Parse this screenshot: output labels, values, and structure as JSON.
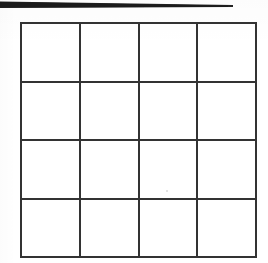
{
  "document": {
    "kind": "scanned-page",
    "background_color": "#ffffff",
    "width": 268,
    "height": 263
  },
  "scan_edge_bar": {
    "name": "scan-edge-shadow-bar",
    "color": "#232323",
    "left": 0,
    "top": 1,
    "right_end": 233,
    "thickness_left": 6,
    "thickness_right": 1,
    "description": ""
  },
  "grid": {
    "title": "",
    "rows": 4,
    "columns": 4,
    "line_color": "#333333",
    "line_width": 2,
    "cell_fill": "#ffffff",
    "bounds": {
      "left": 20,
      "top": 22,
      "right": 257,
      "bottom": 258
    },
    "column_x": [
      20,
      79,
      138,
      197,
      257
    ],
    "row_y": [
      23,
      81,
      139,
      198,
      257
    ],
    "column_headers": [
      "",
      "",
      "",
      ""
    ],
    "row_headers": [
      "",
      "",
      "",
      ""
    ],
    "cells": [
      [
        "",
        "",
        "",
        ""
      ],
      [
        "",
        "",
        "",
        ""
      ],
      [
        "",
        "",
        "",
        ""
      ],
      [
        "",
        "",
        "",
        ""
      ]
    ]
  },
  "artifacts": {
    "speck_label": ""
  }
}
